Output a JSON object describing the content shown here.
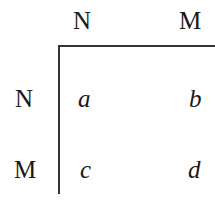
{
  "matrix": {
    "column_headers": [
      "N",
      "M"
    ],
    "row_headers": [
      "N",
      "M"
    ],
    "cells": [
      [
        "a",
        "b"
      ],
      [
        "c",
        "d"
      ]
    ]
  },
  "colors": {
    "text": "#1a1a1a",
    "rule": "#333333",
    "background": "#ffffff"
  }
}
